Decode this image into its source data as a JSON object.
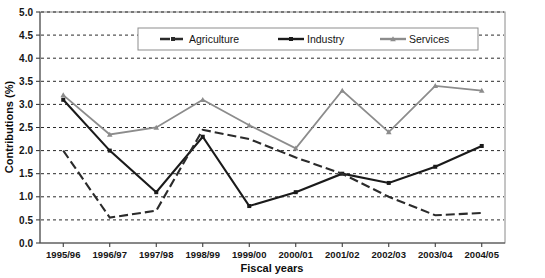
{
  "chart_data": {
    "type": "line",
    "title": "",
    "xlabel": "Fiscal years",
    "ylabel": "Contributions (%)",
    "categories": [
      "1995/96",
      "1996/97",
      "1997/98",
      "1998/99",
      "1999/00",
      "2000/01",
      "2001/02",
      "2002/03",
      "2003/04",
      "2004/05"
    ],
    "ylim": [
      0.0,
      5.0
    ],
    "ytick_labels": [
      "0.0",
      "0.5",
      "1.0",
      "1.5",
      "2.0",
      "2.5",
      "3.0",
      "3.5",
      "4.0",
      "4.5",
      "5.0"
    ],
    "ytick_values": [
      0.0,
      0.5,
      1.0,
      1.5,
      2.0,
      2.5,
      3.0,
      3.5,
      4.0,
      4.5,
      5.0
    ],
    "grid": true,
    "legend_position": "top-center",
    "series": [
      {
        "name": "Agriculture",
        "color": "#2b2b2b",
        "style": "dashed",
        "marker": "none",
        "values": [
          2.0,
          0.55,
          0.7,
          2.45,
          2.25,
          1.85,
          1.5,
          1.0,
          0.6,
          0.65
        ]
      },
      {
        "name": "Industry",
        "color": "#1a1a1a",
        "style": "solid",
        "marker": "square",
        "values": [
          3.1,
          2.0,
          1.1,
          2.3,
          0.8,
          1.1,
          1.5,
          1.3,
          1.65,
          2.1
        ]
      },
      {
        "name": "Services",
        "color": "#8c8c8c",
        "style": "solid",
        "marker": "triangle",
        "values": [
          3.2,
          2.35,
          2.5,
          3.1,
          2.55,
          2.05,
          3.3,
          2.4,
          3.4,
          3.3
        ]
      }
    ]
  },
  "legend": {
    "items": [
      {
        "label": "Agriculture"
      },
      {
        "label": "Industry"
      },
      {
        "label": "Services"
      }
    ]
  }
}
